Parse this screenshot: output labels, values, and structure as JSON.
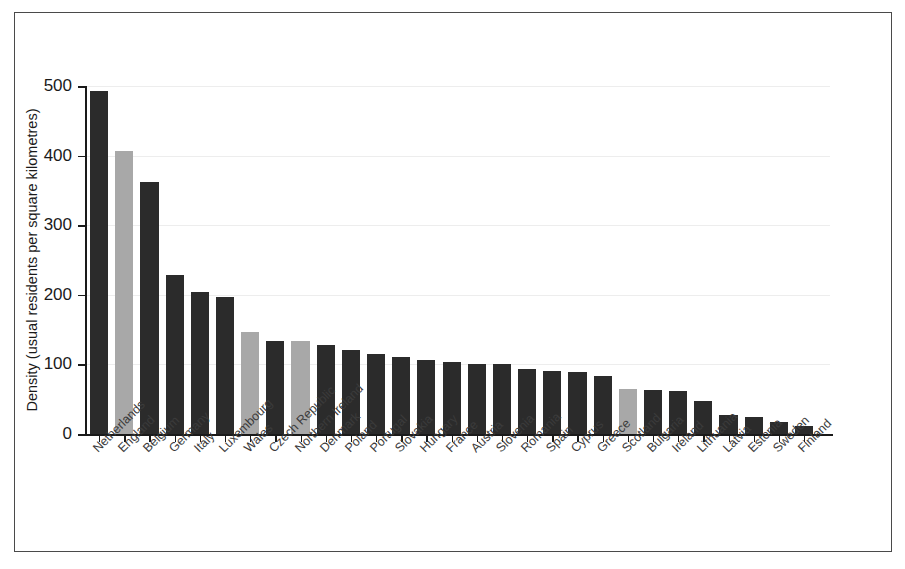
{
  "figure": {
    "border_color": "#4a4a4a",
    "background": "#ffffff"
  },
  "chart_data": {
    "type": "bar",
    "title": "",
    "xlabel": "",
    "ylabel": "Density (usual residents per square kilometres)",
    "ylim": [
      0,
      500
    ],
    "yticks": [
      0,
      100,
      200,
      300,
      400,
      500
    ],
    "ytick_labels": [
      "0",
      "100",
      "200",
      "300",
      "400",
      "500"
    ],
    "grid": true,
    "grid_axis": "y",
    "grid_color": "#ededed",
    "legend": null,
    "orientation": "vertical",
    "sort": "descending",
    "bar_colors": {
      "default": "#2b2b2b",
      "highlight": "#a8a8a8"
    },
    "highlight_note": "UK constituent countries shown in light grey",
    "categories": [
      "Netherlands",
      "England",
      "Belgium",
      "Germany",
      "Italy",
      "Luxembourg",
      "Wales",
      "Czech Republic",
      "Northern Ireland",
      "Denmark",
      "Poland",
      "Portugal",
      "Slovakia",
      "Hungary",
      "France",
      "Austria",
      "Slovenia",
      "Romania",
      "Spain",
      "Cyprus",
      "Greece",
      "Scotland",
      "Bulgaria",
      "Ireland",
      "Lithuania",
      "Latvia",
      "Estonia",
      "Sweden",
      "Finland"
    ],
    "values": [
      493,
      406,
      362,
      229,
      204,
      197,
      147,
      134,
      133,
      128,
      121,
      115,
      110,
      106,
      104,
      101,
      101,
      93,
      91,
      89,
      83,
      65,
      63,
      62,
      47,
      28,
      24,
      17,
      12
    ],
    "colors": [
      "#2b2b2b",
      "#a8a8a8",
      "#2b2b2b",
      "#2b2b2b",
      "#2b2b2b",
      "#2b2b2b",
      "#a8a8a8",
      "#2b2b2b",
      "#a8a8a8",
      "#2b2b2b",
      "#2b2b2b",
      "#2b2b2b",
      "#2b2b2b",
      "#2b2b2b",
      "#2b2b2b",
      "#2b2b2b",
      "#2b2b2b",
      "#2b2b2b",
      "#2b2b2b",
      "#2b2b2b",
      "#2b2b2b",
      "#a8a8a8",
      "#2b2b2b",
      "#2b2b2b",
      "#2b2b2b",
      "#2b2b2b",
      "#2b2b2b",
      "#2b2b2b",
      "#2b2b2b"
    ]
  }
}
